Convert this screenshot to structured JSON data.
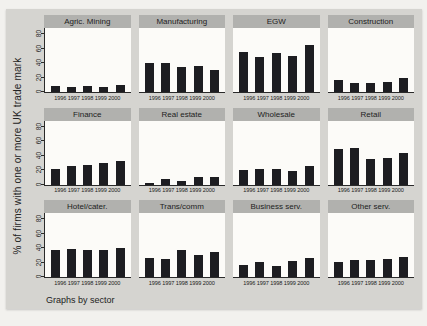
{
  "figure": {
    "footer": "Graphs by sector",
    "colors": {
      "bar": "#1d1d21",
      "strip": "#b1b1ae",
      "canvas_bg": "#d5d4d0",
      "plot_bg": "#fcfbf8",
      "page_bg": "#f2f1ee"
    }
  },
  "chart_data": {
    "type": "bar",
    "layout": "small-multiples 3 rows x 4 cols, shared axes",
    "ylabel": "% of firms with one or more UK trade mark",
    "note": "Graphs by sector",
    "categories": [
      "1996",
      "1997",
      "1998",
      "1999",
      "2000"
    ],
    "ylim": [
      0,
      90
    ],
    "yticks": [
      0,
      20,
      40,
      60,
      80
    ],
    "grid": false,
    "panels": [
      {
        "title": "Agric. Mining",
        "values": [
          8,
          7,
          9,
          7,
          10
        ]
      },
      {
        "title": "Manufacturing",
        "values": [
          40,
          40,
          34,
          36,
          31
        ]
      },
      {
        "title": "EGW",
        "values": [
          55,
          48,
          54,
          50,
          65
        ]
      },
      {
        "title": "Construction",
        "values": [
          17,
          12,
          12,
          14,
          20
        ]
      },
      {
        "title": "Finance",
        "values": [
          21,
          25,
          27,
          30,
          33
        ]
      },
      {
        "title": "Real estate",
        "values": [
          2,
          8,
          5,
          11,
          10
        ]
      },
      {
        "title": "Wholesale",
        "values": [
          20,
          22,
          21,
          19,
          26
        ]
      },
      {
        "title": "Retail",
        "values": [
          49,
          50,
          36,
          37,
          44
        ]
      },
      {
        "title": "Hotel/cater.",
        "values": [
          37,
          39,
          37,
          37,
          40
        ]
      },
      {
        "title": "Trans/comm",
        "values": [
          27,
          25,
          38,
          31,
          34
        ]
      },
      {
        "title": "Business serv.",
        "values": [
          16,
          21,
          15,
          22,
          27
        ]
      },
      {
        "title": "Other serv.",
        "values": [
          21,
          24,
          23,
          25,
          28
        ]
      }
    ]
  }
}
